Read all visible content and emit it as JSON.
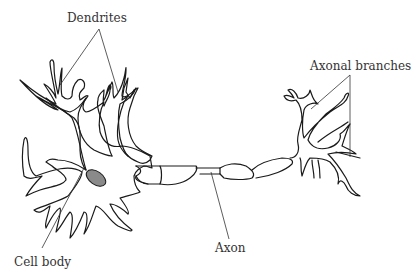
{
  "diagram": {
    "labels": {
      "dendrites": "Dendrites",
      "axonal_branches": "Axonal branches",
      "axon": "Axon",
      "cell_body": "Cell body"
    },
    "colors": {
      "outline": "#1a1a1a",
      "nucleus_fill": "#8a8a8a",
      "label_text": "#333333",
      "background": "#ffffff"
    }
  }
}
